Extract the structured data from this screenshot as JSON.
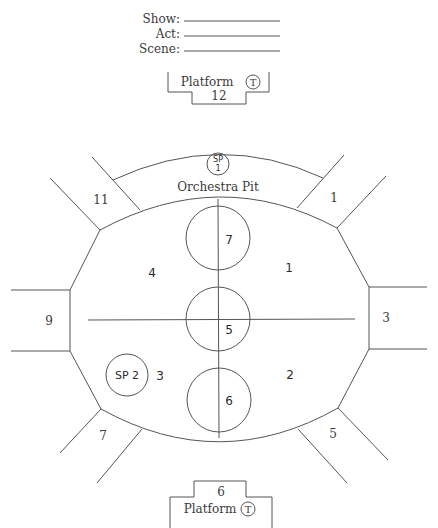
{
  "header": {
    "fields": [
      {
        "label": "Show:",
        "value": ""
      },
      {
        "label": "Act:",
        "value": ""
      },
      {
        "label": "Scene:",
        "value": ""
      }
    ]
  },
  "top_platform": {
    "label": "Platform",
    "number": "12",
    "marker": "T"
  },
  "bottom_platform": {
    "label": "Platform",
    "number": "6",
    "marker": "T"
  },
  "orchestra_pit": {
    "label": "Orchestra Pit",
    "special_position": {
      "line1": "SP",
      "line2": "1"
    }
  },
  "special_position_2": {
    "label": "SP 2"
  },
  "wings": {
    "upper_left": "11",
    "upper_right": "1",
    "left": "9",
    "right": "3",
    "lower_left": "7",
    "lower_right": "5"
  },
  "stage_zones": {
    "upper_left": "4",
    "upper_right": "1",
    "lower_left": "3",
    "lower_right": "2"
  },
  "center_circles": {
    "top": "7",
    "middle": "5",
    "bottom": "6"
  },
  "colors": {
    "line": "#555555",
    "text": "#3a3a3a",
    "background": "#ffffff"
  }
}
